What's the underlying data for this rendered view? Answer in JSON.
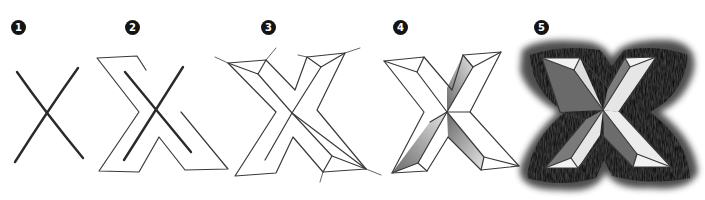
{
  "figure": {
    "steps": [
      {
        "number": "1",
        "label": "Cross lines",
        "badge_x": 11,
        "badge_y": 20
      },
      {
        "number": "2",
        "label": "Outline letter",
        "badge_x": 125,
        "badge_y": 20
      },
      {
        "number": "3",
        "label": "Add bevel guides",
        "badge_x": 261,
        "badge_y": 20
      },
      {
        "number": "4",
        "label": "Shade bevel faces",
        "badge_x": 393,
        "badge_y": 20
      },
      {
        "number": "5",
        "label": "Add dark background hatching",
        "badge_x": 534,
        "badge_y": 20
      }
    ],
    "colors": {
      "background": "#ffffff",
      "badge": "#141414",
      "badge_text": "#ffffff",
      "pencil_line": "#3a3a3a",
      "shade_light": "#c8c8c8",
      "shade_mid": "#8a8a8a",
      "shade_dark": "#3c3c3c"
    }
  }
}
